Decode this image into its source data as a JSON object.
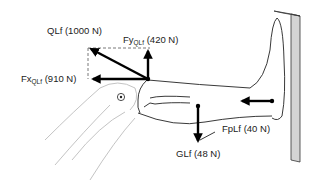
{
  "diagram": {
    "type": "free-body-diagram",
    "forces": [
      {
        "id": "QLf",
        "label": "QLf",
        "value": "(1000 N)",
        "direction": "up-left diagonal"
      },
      {
        "id": "FyQLf",
        "label_main": "Fy",
        "label_sub": "QLf",
        "value": "(420 N)",
        "direction": "up"
      },
      {
        "id": "FxQLf",
        "label_main": "Fx",
        "label_sub": "QLf",
        "value": "(910 N)",
        "direction": "left"
      },
      {
        "id": "FpLf",
        "label": "FpLf",
        "value": "(40 N)",
        "direction": "left"
      },
      {
        "id": "GLf",
        "label": "GLf",
        "value": "(48 N)",
        "direction": "down"
      }
    ],
    "joint_marker": "knee-axis",
    "colors": {
      "vector": "#000000",
      "outline": "#222222",
      "bone": "#bbbbbb",
      "wall": "#cccccc"
    }
  }
}
